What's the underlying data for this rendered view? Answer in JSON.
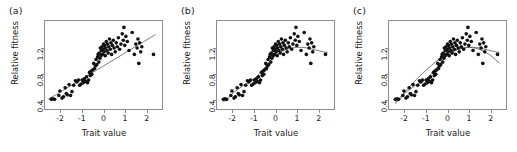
{
  "figure": {
    "background": "#ffffff",
    "point_color": "#111111",
    "line_color": "#5a5a5a",
    "frame_color": "#8d8d8d"
  },
  "chart_data": [
    {
      "type": "scatter",
      "panel_label": "(a)",
      "title": "",
      "xlabel": "Trait value",
      "ylabel": "Relative fitness",
      "xlim": [
        -2.75,
        2.75
      ],
      "ylim": [
        0.25,
        1.62
      ],
      "xticks": [
        -2,
        -1,
        0,
        1,
        2
      ],
      "xticklabels": [
        "-2",
        "-1",
        "0",
        "1",
        "2"
      ],
      "yticks": [
        0.4,
        0.8,
        1.2
      ],
      "yticklabels": [
        "0.4",
        "0.8",
        "1.2"
      ],
      "grid": false,
      "legend": "none",
      "fit": {
        "kind": "linear",
        "label": "linear regression",
        "x": [
          -2.6,
          -2.0,
          -1.5,
          -1.0,
          -0.5,
          0.0,
          0.5,
          1.0,
          1.5,
          2.0,
          2.45
        ],
        "y": [
          0.4,
          0.52,
          0.62,
          0.72,
          0.82,
          0.92,
          1.02,
          1.12,
          1.22,
          1.32,
          1.41
        ]
      },
      "points": {
        "x": [
          -2.45,
          -2.38,
          -2.3,
          -2.1,
          -2.05,
          -1.95,
          -1.88,
          -1.8,
          -1.75,
          -1.7,
          -1.62,
          -1.55,
          -1.48,
          -1.4,
          -1.32,
          -1.25,
          -1.18,
          -1.12,
          -1.05,
          -1.0,
          -0.95,
          -0.9,
          -0.85,
          -0.8,
          -0.75,
          -0.7,
          -0.66,
          -0.62,
          -0.58,
          -0.55,
          -0.5,
          -0.46,
          -0.42,
          -0.38,
          -0.35,
          -0.32,
          -0.28,
          -0.25,
          -0.22,
          -0.2,
          -0.17,
          -0.15,
          -0.12,
          -0.1,
          -0.07,
          -0.05,
          -0.02,
          0.0,
          0.03,
          0.05,
          0.08,
          0.1,
          0.13,
          0.16,
          0.19,
          0.22,
          0.25,
          0.28,
          0.32,
          0.35,
          0.38,
          0.42,
          0.46,
          0.5,
          0.55,
          0.6,
          0.65,
          0.7,
          0.76,
          0.82,
          0.88,
          0.93,
          0.96,
          1.0,
          1.05,
          1.12,
          1.2,
          1.35,
          1.45,
          1.52,
          1.58,
          1.62,
          1.66,
          1.7,
          1.75,
          1.8,
          2.35
        ],
        "y": [
          0.4,
          0.41,
          0.4,
          0.46,
          0.53,
          0.42,
          0.44,
          0.58,
          0.49,
          0.47,
          0.63,
          0.46,
          0.52,
          0.62,
          0.69,
          0.67,
          0.7,
          0.62,
          0.64,
          0.7,
          0.66,
          0.72,
          0.68,
          0.75,
          0.66,
          0.7,
          0.82,
          0.77,
          0.84,
          0.79,
          0.86,
          0.96,
          0.88,
          0.92,
          1.02,
          0.94,
          1.06,
          1.1,
          0.98,
          1.12,
          1.04,
          1.2,
          1.08,
          1.16,
          1.22,
          1.1,
          1.18,
          1.26,
          1.14,
          1.24,
          1.08,
          1.2,
          1.3,
          1.16,
          1.26,
          1.12,
          1.22,
          1.34,
          1.18,
          1.28,
          1.1,
          1.24,
          1.32,
          1.2,
          1.14,
          1.28,
          1.22,
          1.36,
          1.18,
          1.26,
          1.42,
          1.32,
          1.52,
          1.24,
          1.38,
          1.3,
          1.16,
          1.44,
          1.1,
          1.26,
          1.2,
          1.34,
          0.96,
          1.28,
          1.14,
          1.22,
          1.1
        ]
      }
    },
    {
      "type": "scatter",
      "panel_label": "(b)",
      "title": "",
      "xlabel": "Trait value",
      "ylabel": "Relative fitness",
      "xlim": [
        -2.75,
        2.75
      ],
      "ylim": [
        0.25,
        1.62
      ],
      "xticks": [
        -2,
        -1,
        0,
        1,
        2
      ],
      "xticklabels": [
        "-2",
        "-1",
        "0",
        "1",
        "2"
      ],
      "yticks": [
        0.4,
        0.8,
        1.2
      ],
      "yticklabels": [
        "0.4",
        "0.8",
        "1.2"
      ],
      "grid": false,
      "legend": "none",
      "fit": {
        "kind": "spline-saturating",
        "label": "cubic spline",
        "x": [
          -2.45,
          -2.2,
          -2.0,
          -1.75,
          -1.5,
          -1.25,
          -1.0,
          -0.75,
          -0.5,
          -0.25,
          0.0,
          0.25,
          0.5,
          0.75,
          1.0,
          1.25,
          1.5,
          1.75,
          2.0,
          2.25,
          2.45
        ],
        "y": [
          0.36,
          0.42,
          0.5,
          0.56,
          0.62,
          0.66,
          0.72,
          0.8,
          0.9,
          1.0,
          1.08,
          1.14,
          1.18,
          1.2,
          1.21,
          1.21,
          1.2,
          1.18,
          1.16,
          1.14,
          1.13
        ]
      },
      "points": {
        "x": [
          -2.45,
          -2.38,
          -2.3,
          -2.1,
          -2.05,
          -1.95,
          -1.88,
          -1.8,
          -1.75,
          -1.7,
          -1.62,
          -1.55,
          -1.48,
          -1.4,
          -1.32,
          -1.25,
          -1.18,
          -1.12,
          -1.05,
          -1.0,
          -0.95,
          -0.9,
          -0.85,
          -0.8,
          -0.75,
          -0.7,
          -0.66,
          -0.62,
          -0.58,
          -0.55,
          -0.5,
          -0.46,
          -0.42,
          -0.38,
          -0.35,
          -0.32,
          -0.28,
          -0.25,
          -0.22,
          -0.2,
          -0.17,
          -0.15,
          -0.12,
          -0.1,
          -0.07,
          -0.05,
          -0.02,
          0.0,
          0.03,
          0.05,
          0.08,
          0.1,
          0.13,
          0.16,
          0.19,
          0.22,
          0.25,
          0.28,
          0.32,
          0.35,
          0.38,
          0.42,
          0.46,
          0.5,
          0.55,
          0.6,
          0.65,
          0.7,
          0.76,
          0.82,
          0.88,
          0.93,
          0.96,
          1.0,
          1.05,
          1.12,
          1.2,
          1.35,
          1.45,
          1.52,
          1.58,
          1.62,
          1.66,
          1.7,
          1.75,
          1.8,
          2.35
        ],
        "y": [
          0.4,
          0.41,
          0.4,
          0.46,
          0.53,
          0.42,
          0.44,
          0.58,
          0.49,
          0.47,
          0.63,
          0.46,
          0.52,
          0.62,
          0.69,
          0.67,
          0.7,
          0.62,
          0.64,
          0.7,
          0.66,
          0.72,
          0.68,
          0.75,
          0.66,
          0.7,
          0.82,
          0.77,
          0.84,
          0.79,
          0.86,
          0.96,
          0.88,
          0.92,
          1.02,
          0.94,
          1.06,
          1.1,
          0.98,
          1.12,
          1.04,
          1.2,
          1.08,
          1.16,
          1.22,
          1.1,
          1.18,
          1.26,
          1.14,
          1.24,
          1.08,
          1.2,
          1.3,
          1.16,
          1.26,
          1.12,
          1.22,
          1.34,
          1.18,
          1.28,
          1.1,
          1.24,
          1.32,
          1.2,
          1.14,
          1.28,
          1.22,
          1.36,
          1.18,
          1.26,
          1.42,
          1.32,
          1.52,
          1.24,
          1.38,
          1.3,
          1.16,
          1.44,
          1.1,
          1.26,
          1.2,
          1.34,
          0.96,
          1.28,
          1.14,
          1.22,
          1.1
        ]
      }
    },
    {
      "type": "scatter",
      "panel_label": "(c)",
      "title": "",
      "xlabel": "Trait value",
      "ylabel": "Relative fitness",
      "xlim": [
        -2.75,
        2.75
      ],
      "ylim": [
        0.25,
        1.62
      ],
      "xticks": [
        -2,
        -1,
        0,
        1,
        2
      ],
      "xticklabels": [
        "-2",
        "-1",
        "0",
        "1",
        "2"
      ],
      "yticks": [
        0.4,
        0.8,
        1.2
      ],
      "yticklabels": [
        "0.4",
        "0.8",
        "1.2"
      ],
      "grid": false,
      "legend": "none",
      "fit": {
        "kind": "spline-saturating",
        "label": "cubic spline",
        "x": [
          -2.45,
          -2.2,
          -2.0,
          -1.75,
          -1.5,
          -1.25,
          -1.0,
          -0.75,
          -0.5,
          -0.25,
          0.0,
          0.25,
          0.5,
          0.75,
          1.0,
          1.25,
          1.5,
          1.75,
          2.0,
          2.25,
          2.45
        ],
        "y": [
          0.36,
          0.42,
          0.5,
          0.56,
          0.62,
          0.66,
          0.72,
          0.8,
          0.9,
          1.0,
          1.08,
          1.14,
          1.18,
          1.2,
          1.21,
          1.21,
          1.2,
          1.18,
          1.16,
          1.14,
          1.13
        ]
      },
      "fit2": {
        "kind": "quadratic",
        "label": "quadratic regression",
        "x": [
          -2.45,
          -2.2,
          -2.0,
          -1.75,
          -1.5,
          -1.25,
          -1.0,
          -0.75,
          -0.5,
          -0.25,
          0.0,
          0.25,
          0.5,
          0.75,
          1.0,
          1.25,
          1.5,
          1.75,
          2.0,
          2.25,
          2.45
        ],
        "y": [
          0.33,
          0.44,
          0.52,
          0.61,
          0.7,
          0.78,
          0.86,
          0.93,
          1.0,
          1.06,
          1.11,
          1.15,
          1.18,
          1.2,
          1.21,
          1.2,
          1.18,
          1.14,
          1.09,
          1.02,
          0.96
        ]
      },
      "points": {
        "x": [
          -2.45,
          -2.38,
          -2.3,
          -2.1,
          -2.05,
          -1.95,
          -1.88,
          -1.8,
          -1.75,
          -1.7,
          -1.62,
          -1.55,
          -1.48,
          -1.4,
          -1.32,
          -1.25,
          -1.18,
          -1.12,
          -1.05,
          -1.0,
          -0.95,
          -0.9,
          -0.85,
          -0.8,
          -0.75,
          -0.7,
          -0.66,
          -0.62,
          -0.58,
          -0.55,
          -0.5,
          -0.46,
          -0.42,
          -0.38,
          -0.35,
          -0.32,
          -0.28,
          -0.25,
          -0.22,
          -0.2,
          -0.17,
          -0.15,
          -0.12,
          -0.1,
          -0.07,
          -0.05,
          -0.02,
          0.0,
          0.03,
          0.05,
          0.08,
          0.1,
          0.13,
          0.16,
          0.19,
          0.22,
          0.25,
          0.28,
          0.32,
          0.35,
          0.38,
          0.42,
          0.46,
          0.5,
          0.55,
          0.6,
          0.65,
          0.7,
          0.76,
          0.82,
          0.88,
          0.93,
          0.96,
          1.0,
          1.05,
          1.12,
          1.2,
          1.35,
          1.45,
          1.52,
          1.58,
          1.62,
          1.66,
          1.7,
          1.75,
          1.8,
          2.35
        ],
        "y": [
          0.4,
          0.41,
          0.4,
          0.46,
          0.53,
          0.42,
          0.44,
          0.58,
          0.49,
          0.47,
          0.63,
          0.46,
          0.52,
          0.62,
          0.69,
          0.67,
          0.7,
          0.62,
          0.64,
          0.7,
          0.66,
          0.72,
          0.68,
          0.75,
          0.66,
          0.7,
          0.82,
          0.77,
          0.84,
          0.79,
          0.86,
          0.96,
          0.88,
          0.92,
          1.02,
          0.94,
          1.06,
          1.1,
          0.98,
          1.12,
          1.04,
          1.2,
          1.08,
          1.16,
          1.22,
          1.1,
          1.18,
          1.26,
          1.14,
          1.24,
          1.08,
          1.2,
          1.3,
          1.16,
          1.26,
          1.12,
          1.22,
          1.34,
          1.18,
          1.28,
          1.1,
          1.24,
          1.32,
          1.2,
          1.14,
          1.28,
          1.22,
          1.36,
          1.18,
          1.26,
          1.42,
          1.32,
          1.52,
          1.24,
          1.38,
          1.3,
          1.16,
          1.44,
          1.1,
          1.26,
          1.2,
          1.34,
          0.96,
          1.28,
          1.14,
          1.22,
          1.1
        ]
      }
    }
  ]
}
